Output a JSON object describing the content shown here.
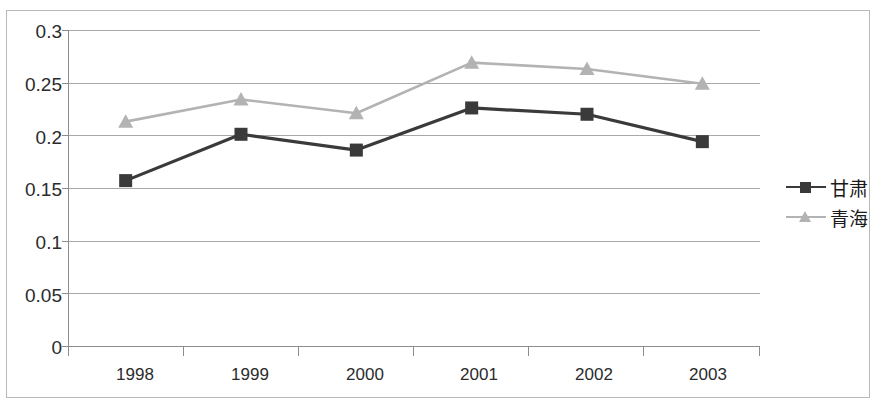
{
  "chart_data": {
    "type": "line",
    "title": "",
    "xlabel": "",
    "ylabel": "",
    "categories": [
      "1998",
      "1999",
      "2000",
      "2001",
      "2002",
      "2003"
    ],
    "ylim": [
      0,
      0.3
    ],
    "y_ticks": [
      "0",
      "0.05",
      "0.1",
      "0.15",
      "0.2",
      "0.25",
      "0.3"
    ],
    "y_tick_values": [
      0,
      0.05,
      0.1,
      0.15,
      0.2,
      0.25,
      0.3
    ],
    "grid": "horizontal",
    "legend_position": "right",
    "series": [
      {
        "name": "甘肃",
        "marker": "square",
        "color": "#3a3a3a",
        "values": [
          0.157,
          0.201,
          0.186,
          0.226,
          0.22,
          0.194
        ]
      },
      {
        "name": "青海",
        "marker": "triangle",
        "color": "#b3b3b3",
        "values": [
          0.213,
          0.234,
          0.221,
          0.269,
          0.263,
          0.249
        ]
      }
    ]
  },
  "axes": {
    "y_tick_labels": [
      "0.3",
      "0.25",
      "0.2",
      "0.15",
      "0.1",
      "0.05",
      "0"
    ],
    "x_tick_labels": [
      "1998",
      "1999",
      "2000",
      "2001",
      "2002",
      "2003"
    ]
  },
  "legend": {
    "items": [
      {
        "label": "甘肃",
        "color": "#3a3a3a",
        "marker": "square"
      },
      {
        "label": "青海",
        "color": "#b3b3b3",
        "marker": "triangle"
      }
    ]
  },
  "colors": {
    "series_gansu": "#3a3a3a",
    "series_qinghai": "#b3b3b3",
    "grid": "#a8a8a8",
    "axis": "#8c8c8c",
    "text": "#2b2b2b",
    "frame": "#b9b9b9",
    "background": "#ffffff"
  }
}
